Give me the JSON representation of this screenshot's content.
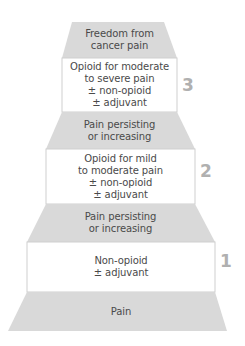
{
  "diagram": {
    "type": "analgesic-ladder",
    "colors": {
      "band_fill": "#d9d9d9",
      "box_fill": "#ffffff",
      "box_border": "#cfcfcf",
      "text": "#4a4a4a",
      "step_number": "#b0b0b0"
    },
    "top": {
      "lines": [
        "Freedom from",
        "cancer pain"
      ]
    },
    "steps": [
      {
        "number": "3",
        "lines": [
          "Opioid for moderate",
          "to severe pain",
          "± non-opioid",
          "± adjuvant"
        ]
      },
      {
        "transition_lines": [
          "Pain persisting",
          "or increasing"
        ]
      },
      {
        "number": "2",
        "lines": [
          "Opioid for mild",
          "to moderate pain",
          "± non-opioid",
          "± adjuvant"
        ]
      },
      {
        "transition_lines": [
          "Pain persisting",
          "or increasing"
        ]
      },
      {
        "number": "1",
        "lines": [
          "Non-opioid",
          "± adjuvant"
        ]
      }
    ],
    "base": {
      "lines": [
        "Pain"
      ]
    }
  }
}
